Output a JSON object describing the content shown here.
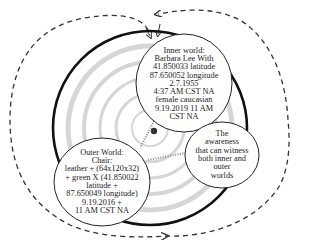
{
  "diagram": {
    "inner_world": {
      "lines": [
        "Inner world:",
        "Barbara Lee With",
        "41.850033 latitude",
        "87.650052 longitude",
        "2.7.1955",
        "4:37 AM CST NA",
        "female caucasian",
        "9.19.2019 11 AM",
        "CST NA"
      ]
    },
    "outer_world": {
      "lines": [
        "Outer World:",
        "Chair:",
        "leather + (64x120x32)",
        "+ green X (41.850022",
        "latitude +",
        "87.650049 longitude)",
        "9.19.2016 +",
        "11 AM CST NA"
      ]
    },
    "awareness": {
      "lines": [
        "The",
        "awareness",
        "that can witness",
        "both inner and",
        "outer",
        "worlds"
      ]
    },
    "colors": {
      "stroke": "#111111",
      "ripple": "#cfcfcf",
      "bubble_fill": "#ffffff",
      "dashed": "#333333"
    }
  }
}
